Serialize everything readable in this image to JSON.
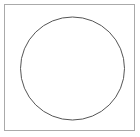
{
  "canvas": {
    "width": 140,
    "height": 137,
    "background_color": "#ffffff",
    "title": "circle-in-square-figure"
  },
  "figure": {
    "type": "geometric-line-drawing",
    "shapes": [
      {
        "name": "square-frame",
        "kind": "rectangle",
        "x": 4.5,
        "y": 4.5,
        "width": 130,
        "height": 126,
        "stroke_color": "#aaaaaa",
        "stroke_width": 1,
        "fill": "none"
      },
      {
        "name": "circle-outline",
        "kind": "circle",
        "center_x": 72.5,
        "center_y": 68.5,
        "radius_x": 52,
        "radius_y": 51.5,
        "stroke_color": "#555555",
        "stroke_width": 1,
        "fill": "none"
      }
    ]
  }
}
